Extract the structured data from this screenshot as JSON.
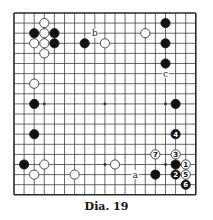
{
  "diagram": {
    "caption": "Dia. 19",
    "board_size": 19,
    "geometry": {
      "left": 14,
      "top": 13,
      "spacing": 10.1,
      "stone_radius": 4.6
    },
    "colors": {
      "line": "#2a2a2a",
      "black": "#111111",
      "white_fill": "#ffffff",
      "white_stroke": "#222222",
      "label": "#222222"
    },
    "star_points": [
      [
        3,
        3
      ],
      [
        9,
        3
      ],
      [
        15,
        3
      ],
      [
        3,
        9
      ],
      [
        9,
        9
      ],
      [
        15,
        9
      ],
      [
        3,
        15
      ],
      [
        9,
        15
      ],
      [
        15,
        15
      ]
    ],
    "stones": [
      {
        "color": "white",
        "col": 3,
        "row": 1,
        "label": ""
      },
      {
        "color": "black",
        "col": 2,
        "row": 2,
        "label": ""
      },
      {
        "color": "white",
        "col": 3,
        "row": 2,
        "label": ""
      },
      {
        "color": "black",
        "col": 4,
        "row": 2,
        "label": ""
      },
      {
        "color": "white",
        "col": 2,
        "row": 3,
        "label": ""
      },
      {
        "color": "white",
        "col": 3,
        "row": 3,
        "label": ""
      },
      {
        "color": "black",
        "col": 4,
        "row": 3,
        "label": ""
      },
      {
        "color": "white",
        "col": 3,
        "row": 4,
        "label": ""
      },
      {
        "color": "black",
        "col": 7,
        "row": 3,
        "label": ""
      },
      {
        "color": "white",
        "col": 9,
        "row": 3,
        "label": ""
      },
      {
        "color": "white",
        "col": 13,
        "row": 2,
        "label": ""
      },
      {
        "color": "black",
        "col": 15,
        "row": 1,
        "label": ""
      },
      {
        "color": "black",
        "col": 15,
        "row": 3,
        "label": ""
      },
      {
        "color": "black",
        "col": 15,
        "row": 5,
        "label": ""
      },
      {
        "color": "white",
        "col": 2,
        "row": 7,
        "label": ""
      },
      {
        "color": "black",
        "col": 2,
        "row": 9,
        "label": ""
      },
      {
        "color": "black",
        "col": 2,
        "row": 12,
        "label": ""
      },
      {
        "color": "black",
        "col": 1,
        "row": 15,
        "label": ""
      },
      {
        "color": "white",
        "col": 3,
        "row": 15,
        "label": ""
      },
      {
        "color": "white",
        "col": 2,
        "row": 16,
        "label": ""
      },
      {
        "color": "white",
        "col": 6,
        "row": 16,
        "label": ""
      },
      {
        "color": "black",
        "col": 16,
        "row": 9,
        "label": ""
      },
      {
        "color": "black",
        "col": 16,
        "row": 12,
        "label": "4"
      },
      {
        "color": "white",
        "col": 14,
        "row": 14,
        "label": "7"
      },
      {
        "color": "white",
        "col": 16,
        "row": 14,
        "label": "3"
      },
      {
        "color": "black",
        "col": 16,
        "row": 15,
        "label": ""
      },
      {
        "color": "white",
        "col": 17,
        "row": 15,
        "label": "1"
      },
      {
        "color": "white",
        "col": 10,
        "row": 15,
        "label": ""
      },
      {
        "color": "black",
        "col": 14,
        "row": 16,
        "label": ""
      },
      {
        "color": "black",
        "col": 16,
        "row": 16,
        "label": "2"
      },
      {
        "color": "white",
        "col": 17,
        "row": 16,
        "label": "5"
      },
      {
        "color": "black",
        "col": 17,
        "row": 17,
        "label": "6"
      }
    ],
    "markers": [
      {
        "text": "b",
        "col": 8,
        "row": 2
      },
      {
        "text": "c",
        "col": 15,
        "row": 6
      },
      {
        "text": "a",
        "col": 12,
        "row": 16
      }
    ]
  }
}
